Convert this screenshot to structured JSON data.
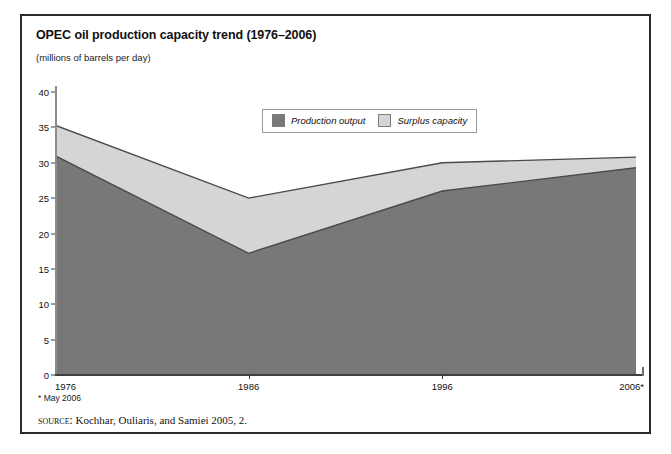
{
  "figure": {
    "title": "OPEC oil production capacity trend (1976–2006)",
    "subtitle": "(millions of barrels per day)",
    "footnote": "* May 2006",
    "source_label": "source:",
    "source_text": " Kochhar, Ouliaris, and Samiei 2005, 2."
  },
  "legend": {
    "position": "top-center-inside",
    "entries": [
      {
        "label": "Production output",
        "color": "#787878"
      },
      {
        "label": "Surplus capacity",
        "color": "#d5d5d5"
      }
    ]
  },
  "colors": {
    "production_fill": "#787878",
    "surplus_fill": "#d5d5d5",
    "series_outline": "#4a4a4a",
    "axis": "#3f3f3f",
    "frame": "#2b2b2b",
    "background": "#ffffff"
  },
  "chart_data": {
    "type": "area",
    "title": "OPEC oil production capacity trend (1976–2006)",
    "subtitle": "(millions of barrels per day)",
    "xlabel": "",
    "ylabel": "millions of barrels per day",
    "stacked": true,
    "grid": false,
    "legend_position": "top-center-inside",
    "x": [
      1976,
      1986,
      1996,
      2006
    ],
    "xtick_labels": [
      "1976",
      "1986",
      "1996",
      "2006*"
    ],
    "xlim": [
      1976,
      2006
    ],
    "ylim": [
      0,
      40
    ],
    "ytick_labels": [
      "0",
      "5",
      "10",
      "15",
      "20",
      "25",
      "30",
      "35",
      "40"
    ],
    "yticks": [
      0,
      5,
      10,
      15,
      20,
      25,
      30,
      35,
      40
    ],
    "series": [
      {
        "name": "Production output",
        "values": [
          31.0,
          17.2,
          26.0,
          29.3
        ],
        "color": "#787878"
      },
      {
        "name": "Surplus capacity",
        "values": [
          4.3,
          7.8,
          4.0,
          1.5
        ],
        "color": "#d5d5d5"
      }
    ],
    "total_capacity": [
      35.3,
      25.0,
      30.0,
      30.8
    ],
    "annotations": [
      "* May 2006"
    ]
  }
}
